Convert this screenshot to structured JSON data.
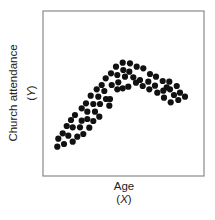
{
  "chart_data": {
    "type": "scatter",
    "title": "",
    "xlabel": "Age",
    "xlabel_symbol": "X",
    "ylabel": "Church attendance",
    "ylabel_symbol": "Y",
    "xticks": [],
    "yticks": [],
    "grid": false,
    "legend": null,
    "plot_area": {
      "left": 43,
      "top": 11,
      "right": 204,
      "bottom": 176
    },
    "points": [
      [
        57.3,
        146.7
      ],
      [
        64.0,
        144.0
      ],
      [
        72.7,
        141.7
      ],
      [
        58.3,
        138.7
      ],
      [
        68.3,
        135.7
      ],
      [
        62.7,
        133.3
      ],
      [
        77.3,
        136.7
      ],
      [
        83.3,
        134.0
      ],
      [
        66.7,
        126.0
      ],
      [
        72.7,
        127.3
      ],
      [
        80.0,
        127.3
      ],
      [
        89.3,
        127.7
      ],
      [
        71.0,
        120.0
      ],
      [
        81.7,
        120.7
      ],
      [
        87.3,
        119.0
      ],
      [
        93.3,
        121.0
      ],
      [
        75.0,
        115.0
      ],
      [
        81.7,
        108.3
      ],
      [
        87.3,
        111.7
      ],
      [
        95.0,
        111.7
      ],
      [
        99.3,
        116.7
      ],
      [
        86.0,
        103.3
      ],
      [
        93.3,
        104.0
      ],
      [
        100.0,
        104.0
      ],
      [
        90.7,
        95.7
      ],
      [
        98.3,
        96.7
      ],
      [
        106.0,
        99.0
      ],
      [
        110.0,
        99.0
      ],
      [
        109.3,
        105.7
      ],
      [
        96.7,
        89.3
      ],
      [
        104.3,
        91.0
      ],
      [
        101.7,
        85.0
      ],
      [
        105.7,
        78.3
      ],
      [
        111.7,
        85.0
      ],
      [
        117.3,
        89.3
      ],
      [
        111.0,
        73.3
      ],
      [
        117.3,
        75.0
      ],
      [
        118.3,
        82.3
      ],
      [
        116.0,
        66.7
      ],
      [
        122.7,
        62.7
      ],
      [
        123.3,
        70.0
      ],
      [
        125.0,
        76.7
      ],
      [
        130.0,
        63.3
      ],
      [
        129.3,
        71.7
      ],
      [
        136.7,
        66.7
      ],
      [
        143.3,
        68.3
      ],
      [
        122.7,
        88.3
      ],
      [
        128.3,
        86.7
      ],
      [
        133.3,
        77.3
      ],
      [
        136.0,
        82.7
      ],
      [
        140.0,
        80.0
      ],
      [
        142.7,
        86.0
      ],
      [
        150.0,
        74.0
      ],
      [
        148.3,
        81.7
      ],
      [
        149.3,
        89.3
      ],
      [
        156.0,
        76.7
      ],
      [
        155.0,
        85.7
      ],
      [
        157.3,
        92.7
      ],
      [
        162.7,
        81.0
      ],
      [
        163.3,
        90.7
      ],
      [
        164.0,
        97.7
      ],
      [
        169.3,
        81.7
      ],
      [
        166.7,
        87.3
      ],
      [
        170.0,
        89.3
      ],
      [
        170.7,
        102.3
      ],
      [
        176.7,
        86.0
      ],
      [
        174.0,
        95.0
      ],
      [
        180.0,
        92.7
      ],
      [
        178.3,
        100.0
      ],
      [
        185.0,
        96.7
      ]
    ],
    "marker": {
      "shape": "circle",
      "radius": 3.1,
      "color": "#111111"
    }
  },
  "colors": {
    "frame": "#8a8a8a",
    "marker": "#111111",
    "text": "#222222",
    "background": "#ffffff"
  }
}
